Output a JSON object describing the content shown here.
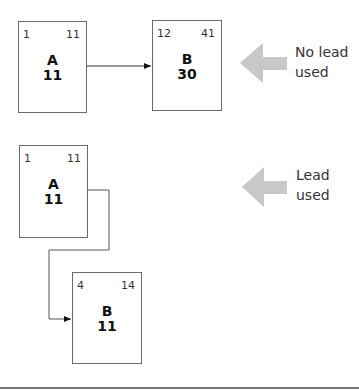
{
  "top_scenario": {
    "label_line1": "No lead",
    "label_line2": "used",
    "box_a": {
      "name": "A",
      "duration": "11",
      "start": "1",
      "finish": "11"
    },
    "box_b": {
      "name": "B",
      "duration": "30",
      "start": "12",
      "finish": "41"
    }
  },
  "bottom_scenario": {
    "label_line1": "Lead",
    "label_line2": "used",
    "box_a": {
      "name": "A",
      "duration": "11",
      "start": "1",
      "finish": "11"
    },
    "box_b": {
      "name": "B",
      "duration": "11",
      "start": "4",
      "finish": "14"
    }
  },
  "colors": {
    "pointer_arrow": "#c8c8c8",
    "border": "#6b6b6b"
  },
  "icons": [
    "arrow-left-icon",
    "connector-arrow-icon"
  ]
}
